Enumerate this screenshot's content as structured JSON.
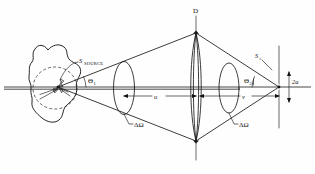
{
  "figure": {
    "kind": "optical-ray-diagram",
    "background_color": "#fefefe",
    "ink_color": "#1a1a1a"
  },
  "labels": {
    "detector_aperture": "D",
    "source_main": "S",
    "source_sub": "SOURCE",
    "image_main": "S",
    "image_sub": "i",
    "theta1_main": "Θ",
    "theta1_sub": "1",
    "theta2_main": "Θ",
    "theta2_sub": "2",
    "object_distance": "u",
    "image_distance": "v",
    "image_size": "2a",
    "solid_angle_left": "ΔΩ",
    "solid_angle_right": "ΔΩ"
  },
  "geometry": {
    "axis_y": 87,
    "axis_x_start": 4,
    "axis_x_end": 311,
    "source_point_x": 58,
    "lens1_x": 124,
    "lens_center_x": 196,
    "lens2_x": 229,
    "image_point_x": 279,
    "detector_line_x": 279,
    "cone_top_y": 33,
    "cone_bottom_y": 141
  },
  "annotations": {
    "description": "Hand-drawn optics schematic: extended source object imaged through a lens of aperture D onto an image point of size 2a; object distance u, image distance v, collection solid angles delta-Omega at half-angles Theta-1 and Theta-2."
  }
}
